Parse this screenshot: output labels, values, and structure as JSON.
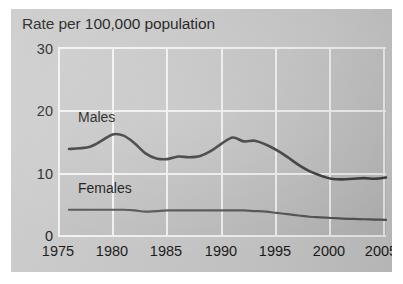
{
  "figure": {
    "title": "Rate per 100,000 population",
    "background_color": "#c9c9c9",
    "plot_background_color": "#c4c4c4",
    "gridline_color": "#f2f2f2"
  },
  "axes": {
    "y_ticks": [
      "0",
      "10",
      "20",
      "30"
    ],
    "x_ticks": [
      "1975",
      "1980",
      "1985",
      "1990",
      "1995",
      "2000",
      "2005"
    ]
  },
  "series_labels": {
    "males": "Males",
    "females": "Females"
  },
  "chart_data": {
    "type": "line",
    "title": "Rate per 100,000 population",
    "xlabel": "",
    "ylabel": "Rate per 100,000 population",
    "xlim": [
      1975,
      2005
    ],
    "ylim": [
      0,
      30
    ],
    "yticks": [
      0,
      10,
      20,
      30
    ],
    "xticks": [
      1975,
      1980,
      1985,
      1990,
      1995,
      2000,
      2005
    ],
    "grid": true,
    "legend": "inline-labels",
    "x": [
      1976,
      1977,
      1978,
      1979,
      1980,
      1981,
      1982,
      1983,
      1984,
      1985,
      1986,
      1987,
      1988,
      1989,
      1990,
      1991,
      1992,
      1993,
      1994,
      1995,
      1996,
      1997,
      1998,
      1999,
      2000,
      2001,
      2002,
      2003,
      2004,
      2005
    ],
    "series": [
      {
        "name": "Males",
        "color": "#3a3a3a",
        "values": [
          13.9,
          14.0,
          14.3,
          15.2,
          16.2,
          16.0,
          14.8,
          13.2,
          12.4,
          12.3,
          12.7,
          12.6,
          12.8,
          13.6,
          14.8,
          15.7,
          15.1,
          15.2,
          14.6,
          13.7,
          12.6,
          11.4,
          10.4,
          9.7,
          9.2,
          9.1,
          9.2,
          9.3,
          9.2,
          9.4
        ]
      },
      {
        "name": "Females",
        "color": "#555555",
        "values": [
          4.3,
          4.3,
          4.3,
          4.3,
          4.3,
          4.3,
          4.2,
          4.0,
          4.1,
          4.2,
          4.2,
          4.2,
          4.2,
          4.2,
          4.2,
          4.2,
          4.2,
          4.1,
          4.0,
          3.8,
          3.6,
          3.4,
          3.2,
          3.1,
          3.0,
          2.9,
          2.85,
          2.8,
          2.75,
          2.7
        ]
      }
    ]
  }
}
